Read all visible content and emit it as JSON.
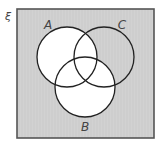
{
  "diagram": {
    "type": "venn",
    "universal_symbol": "ξ",
    "sets": [
      {
        "label": "A",
        "cx": 67,
        "cy": 57,
        "r": 30,
        "label_x": 48,
        "label_y": 26
      },
      {
        "label": "C",
        "cx": 104,
        "cy": 57,
        "r": 30,
        "label_x": 122,
        "label_y": 26
      },
      {
        "label": "B",
        "cx": 85,
        "cy": 87,
        "r": 30,
        "label_x": 85,
        "label_y": 131
      }
    ],
    "shaded_regions": [
      "C only (not A, not B)",
      "outside all sets"
    ],
    "unshaded_regions": [
      "A",
      "B",
      "A∩C",
      "B∩C"
    ],
    "colors": {
      "shade": "#cfcfcf",
      "unshaded": "#ffffff",
      "outline": "#222222",
      "frame": "#555555"
    },
    "frame": {
      "x": 17,
      "y": 9,
      "width": 137,
      "height": 129
    }
  }
}
